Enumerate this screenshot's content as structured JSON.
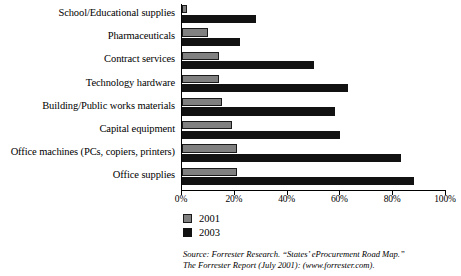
{
  "chart_data": {
    "type": "bar",
    "orientation": "horizontal",
    "title": "",
    "xlabel": "",
    "ylabel": "",
    "xlim": [
      0,
      100
    ],
    "xunit": "%",
    "grid": false,
    "legend_position": "bottom-left",
    "categories": [
      "School/Educational supplies",
      "Pharmaceuticals",
      "Contract services",
      "Technology hardware",
      "Building/Public works materials",
      "Capital equipment",
      "Office machines (PCs, copiers, printers)",
      "Office supplies"
    ],
    "tick_labels": [
      "0%",
      "20%",
      "40%",
      "60%",
      "80%",
      "100%"
    ],
    "tick_values": [
      0,
      20,
      40,
      60,
      80,
      100
    ],
    "series": [
      {
        "name": "2001",
        "color": "#808080",
        "values": [
          2,
          10,
          14,
          14,
          15,
          19,
          21,
          21
        ]
      },
      {
        "name": "2003",
        "color": "#121212",
        "values": [
          28,
          22,
          50,
          63,
          58,
          60,
          83,
          88
        ]
      }
    ]
  },
  "legend": {
    "items": [
      {
        "label": "2001",
        "color": "#808080"
      },
      {
        "label": "2003",
        "color": "#121212"
      }
    ]
  },
  "source": {
    "line1": "Source: Forrester Research. “States’ eProcurement Road Map.”",
    "line2": "The Forrester Report (July 2001): (www.forrester.com)."
  }
}
